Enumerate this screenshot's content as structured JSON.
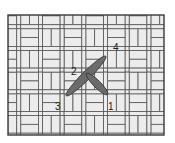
{
  "diagram": {
    "colors": {
      "frame": "#3a3a3a",
      "brick_fill": "#ececec",
      "brick_stroke": "#555555",
      "stitch_fill": "#6b6b6b",
      "stitch_stroke": "#333333",
      "background": "#ffffff"
    },
    "stitches": [
      {
        "name": "long-stitch",
        "from": "3",
        "to": "4"
      },
      {
        "name": "short-stitch",
        "from": "2",
        "to": "1"
      }
    ],
    "labels": [
      {
        "text": "1",
        "x": 108,
        "y": 110
      },
      {
        "text": "2",
        "x": 71,
        "y": 75
      },
      {
        "text": "3",
        "x": 55,
        "y": 110
      },
      {
        "text": "4",
        "x": 113,
        "y": 51
      }
    ]
  }
}
